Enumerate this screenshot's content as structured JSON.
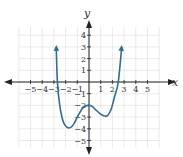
{
  "chart_data": {
    "type": "line",
    "title": "",
    "xlabel": "x",
    "ylabel": "y",
    "xlim": [
      -6,
      6
    ],
    "ylim": [
      -5,
      5
    ],
    "grid": true,
    "x_ticks": [
      "-5",
      "-4",
      "-3",
      "-2",
      "-1",
      "1",
      "2",
      "3",
      "4",
      "5"
    ],
    "y_ticks": [
      "4",
      "3",
      "2",
      "1",
      "-1",
      "-2",
      "-3",
      "-4",
      "-5"
    ],
    "curve_color": "#2f6e8c",
    "series": [
      {
        "name": "polynomial",
        "x": [
          -2.8,
          -2.7,
          -2.5,
          -2.2,
          -1.9,
          -1.6,
          -1.3,
          -1.0,
          -0.6,
          -0.3,
          0.0,
          0.3,
          0.6,
          1.0,
          1.3,
          1.6,
          1.9,
          2.2,
          2.5,
          2.8
        ],
        "y": [
          3.0,
          0.0,
          -2.0,
          -3.4,
          -3.85,
          -3.9,
          -3.6,
          -3.0,
          -2.3,
          -2.05,
          -2.0,
          -2.1,
          -2.4,
          -2.75,
          -2.9,
          -2.85,
          -2.3,
          -1.2,
          0.0,
          3.0
        ]
      }
    ],
    "end_behavior": "both ends point upward with arrows",
    "key_points": {
      "x_intercepts": [
        -2.7,
        2.5
      ],
      "local_max": [
        0,
        -2
      ],
      "local_min_left": [
        -1.6,
        -3.9
      ],
      "local_min_right": [
        1.6,
        -2.9
      ]
    }
  },
  "labels": {
    "x_axis": "x",
    "y_axis": "y"
  }
}
